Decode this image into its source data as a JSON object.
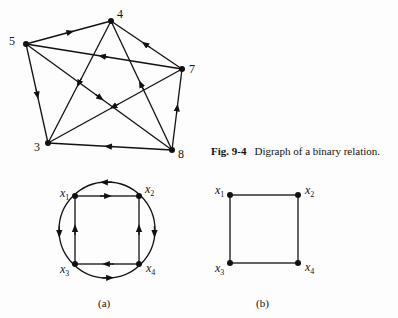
{
  "caption": {
    "figure": "Fig. 9-4",
    "text": "Digraph of a binary relation."
  },
  "top_graph": {
    "nodes": [
      {
        "id": "4",
        "x": 111,
        "y": 21,
        "lx": 117,
        "ly": 18
      },
      {
        "id": "5",
        "x": 26,
        "y": 44,
        "lx": 9,
        "ly": 45
      },
      {
        "id": "7",
        "x": 182,
        "y": 69,
        "lx": 189,
        "ly": 73
      },
      {
        "id": "3",
        "x": 48,
        "y": 143,
        "lx": 34,
        "ly": 151
      },
      {
        "id": "8",
        "x": 172,
        "y": 150,
        "lx": 178,
        "ly": 158
      }
    ],
    "edges": [
      {
        "from": "5",
        "to": "4"
      },
      {
        "from": "7",
        "to": "5"
      },
      {
        "from": "5",
        "to": "3"
      },
      {
        "from": "5",
        "to": "8"
      },
      {
        "from": "7",
        "to": "4"
      },
      {
        "from": "4",
        "to": "3"
      },
      {
        "from": "8",
        "to": "4"
      },
      {
        "from": "7",
        "to": "3"
      },
      {
        "from": "8",
        "to": "7"
      },
      {
        "from": "8",
        "to": "3"
      }
    ]
  },
  "graph_a": {
    "label": "(a)",
    "nodes": [
      "x1",
      "x2",
      "x3",
      "x4"
    ],
    "edges": [
      {
        "from": "x1",
        "to": "x2",
        "type": "straight"
      },
      {
        "from": "x2",
        "to": "x1",
        "type": "arc"
      },
      {
        "from": "x2",
        "to": "x4",
        "type": "arc"
      },
      {
        "from": "x4",
        "to": "x2",
        "type": "straight"
      },
      {
        "from": "x4",
        "to": "x3",
        "type": "straight"
      },
      {
        "from": "x3",
        "to": "x4",
        "type": "arc"
      },
      {
        "from": "x3",
        "to": "x1",
        "type": "straight"
      },
      {
        "from": "x1",
        "to": "x3",
        "type": "arc"
      }
    ]
  },
  "graph_b": {
    "label": "(b)",
    "nodes": [
      "x1",
      "x2",
      "x3",
      "x4"
    ],
    "edges": [
      [
        "x1",
        "x2"
      ],
      [
        "x2",
        "x4"
      ],
      [
        "x4",
        "x3"
      ],
      [
        "x3",
        "x1"
      ]
    ]
  }
}
